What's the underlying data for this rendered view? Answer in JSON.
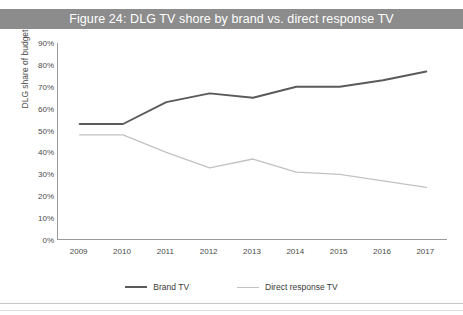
{
  "page": {
    "ghost_text": "",
    "title": "Figure 24: DLG TV shore by brand vs. direct response TV"
  },
  "colors": {
    "title_bar_bg": "#8c8c8c",
    "title_bar_text": "#ffffff",
    "brand_tv": "#5a5a5a",
    "direct_response_tv": "#c2c2c2",
    "axis": "#9a9a9a",
    "tick_text": "#4a4a4a"
  },
  "legend": {
    "position": "bottom",
    "items": [
      {
        "label": "Brand TV",
        "color": "#5a5a5a"
      },
      {
        "label": "Direct response TV",
        "color": "#c2c2c2"
      }
    ]
  },
  "chart_data": {
    "type": "line",
    "title": "Figure 24: DLG TV shore by brand vs. direct response TV",
    "xlabel": "",
    "ylabel": "DLG share of budget",
    "categories": [
      "2009",
      "2010",
      "2011",
      "2012",
      "2013",
      "2014",
      "2015",
      "2016",
      "2017"
    ],
    "series": [
      {
        "name": "Brand TV",
        "color": "#5a5a5a",
        "values": [
          53,
          53,
          63,
          67,
          65,
          70,
          70,
          73,
          77
        ]
      },
      {
        "name": "Direct response TV",
        "color": "#c2c2c2",
        "values": [
          48,
          48,
          40,
          33,
          37,
          31,
          30,
          27,
          24
        ]
      }
    ],
    "ylim": [
      0,
      90
    ],
    "ytick_values": [
      0,
      10,
      20,
      30,
      40,
      50,
      60,
      70,
      80,
      90
    ],
    "ytick_labels": [
      "0%",
      "10%",
      "20%",
      "30%",
      "40%",
      "50%",
      "60%",
      "70%",
      "80%",
      "90%"
    ],
    "grid": false,
    "units": "percent"
  }
}
